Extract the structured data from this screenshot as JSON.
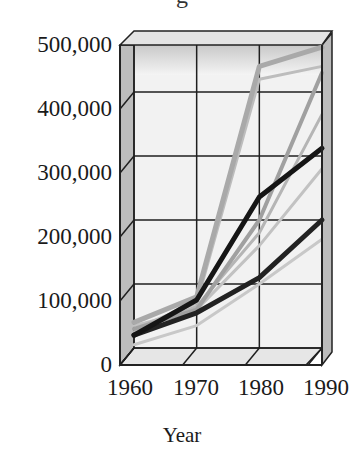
{
  "chart_data": {
    "type": "line",
    "title": "",
    "xlabel": "Year",
    "ylabel": "",
    "x": [
      1960,
      1970,
      1980,
      1990
    ],
    "x_tick_labels": [
      "1960",
      "1970",
      "1980",
      "1990"
    ],
    "y_tick_labels": [
      "500,000",
      "400,000",
      "300,000",
      "200,000",
      "100,000",
      "0"
    ],
    "ylim": [
      0,
      500000
    ],
    "grid": true,
    "style": "3D box frame, gray shaded walls",
    "legend": null,
    "series": [
      {
        "name": "dark series 1",
        "color": "#151515",
        "width": 5,
        "values": [
          20000,
          75000,
          236000,
          312000
        ]
      },
      {
        "name": "dark series 2",
        "color": "#222222",
        "width": 5,
        "values": [
          20000,
          55000,
          110000,
          200000
        ]
      },
      {
        "name": "gray series 1",
        "color": "#a9a9a9",
        "width": 5,
        "values": [
          40000,
          80000,
          440000,
          470000
        ]
      },
      {
        "name": "gray series 2",
        "color": "#bdbdbd",
        "width": 3,
        "values": [
          30000,
          70000,
          420000,
          440000
        ]
      },
      {
        "name": "gray series 3",
        "color": "#a0a0a0",
        "width": 4,
        "values": [
          30000,
          60000,
          200000,
          430000
        ]
      },
      {
        "name": "gray series 4",
        "color": "#b5b5b5",
        "width": 3,
        "values": [
          25000,
          65000,
          180000,
          365000
        ]
      },
      {
        "name": "gray series 5",
        "color": "#c2c2c2",
        "width": 3,
        "values": [
          35000,
          60000,
          160000,
          280000
        ]
      },
      {
        "name": "gray series 6",
        "color": "#c8c8c8",
        "width": 3,
        "values": [
          5000,
          35000,
          100000,
          170000
        ]
      }
    ]
  },
  "title_fragment": "g",
  "axis": {
    "y_ticks": [
      "500,000",
      "400,000",
      "300,000",
      "200,000",
      "100,000",
      "0"
    ],
    "x_ticks": [
      "1960",
      "1970",
      "1980",
      "1990"
    ],
    "x_label": "Year"
  }
}
